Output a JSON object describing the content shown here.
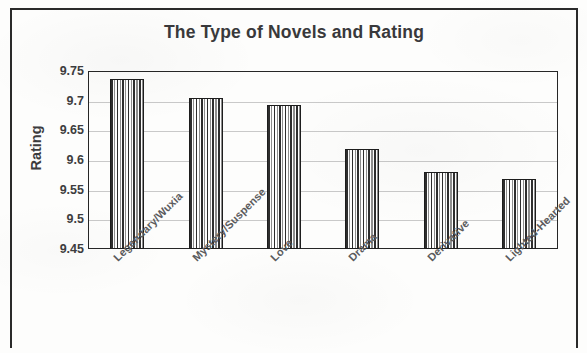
{
  "chart_data": {
    "type": "bar",
    "title": "The Type of Novels and Rating",
    "xlabel": "",
    "ylabel": "Rating",
    "categories": [
      "Legendary/Wuxia",
      "Mystery/Suspense",
      "Love",
      "Drama",
      "Derivative",
      "Lighted-Hearted"
    ],
    "values": [
      9.736,
      9.705,
      9.692,
      9.618,
      9.58,
      9.568
    ],
    "ylim": [
      9.45,
      9.75
    ],
    "ytick_labels": [
      "9.75",
      "9.7",
      "9.65",
      "9.6",
      "9.55",
      "9.5",
      "9.45"
    ],
    "ytick_values": [
      9.75,
      9.7,
      9.65,
      9.6,
      9.55,
      9.5,
      9.45
    ],
    "grid": true,
    "legend": false,
    "bar_fill": "vertical-stripes",
    "bar_outline_color": "#1d1d1d",
    "text_color": "#3c3c3e",
    "grid_color": "#c9c9c9"
  }
}
